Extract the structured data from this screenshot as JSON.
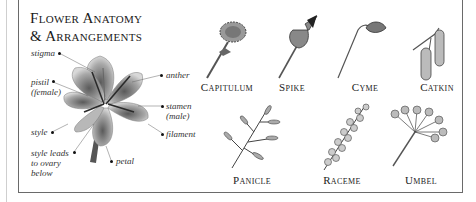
{
  "title": {
    "line1": "Flower Anatomy",
    "line2": "& Arrangements"
  },
  "anatomy_labels": {
    "stigma": "stigma",
    "pistil": "pistil\n(female)",
    "style": "style",
    "style_leads": "style leads\nto ovary\nbelow",
    "anther": "anther",
    "stamen": "stamen\n(male)",
    "filament": "filament",
    "petal": "petal"
  },
  "arrangements": [
    {
      "label": "Capitulum",
      "icon": "capitulum-illustration"
    },
    {
      "label": "Spike",
      "icon": "spike-illustration"
    },
    {
      "label": "Cyme",
      "icon": "cyme-illustration"
    },
    {
      "label": "Catkin",
      "icon": "catkin-illustration"
    },
    {
      "label": "Panicle",
      "icon": "panicle-illustration"
    },
    {
      "label": "Raceme",
      "icon": "raceme-illustration"
    },
    {
      "label": "Umbel",
      "icon": "umbel-illustration"
    }
  ],
  "colors": {
    "border": "#6a6a6a",
    "ink": "#222222",
    "petal_fill": "#9a9a9a"
  }
}
